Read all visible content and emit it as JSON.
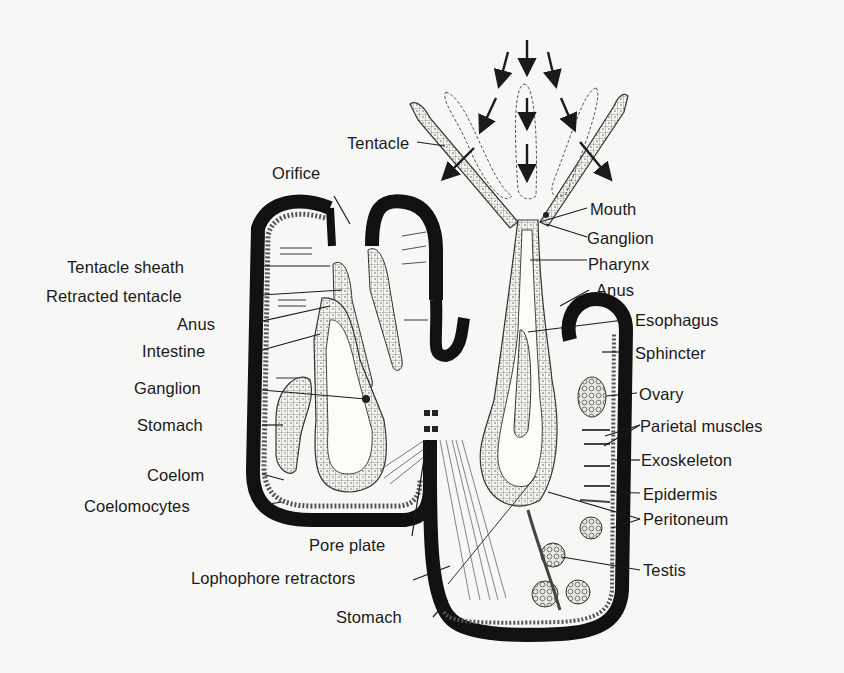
{
  "figure": {
    "colors": {
      "background": "#f7f7f5",
      "ink": "#1a1a1a",
      "exoskeleton": "#111111"
    }
  },
  "labels_left": [
    {
      "id": "orifice",
      "text": "Orifice"
    },
    {
      "id": "tentacle",
      "text": "Tentacle"
    },
    {
      "id": "tentacle-sheath",
      "text": "Tentacle sheath"
    },
    {
      "id": "retracted-tentacle",
      "text": "Retracted tentacle"
    },
    {
      "id": "anus-left",
      "text": "Anus"
    },
    {
      "id": "intestine",
      "text": "Intestine"
    },
    {
      "id": "ganglion-left",
      "text": "Ganglion"
    },
    {
      "id": "stomach-left",
      "text": "Stomach"
    },
    {
      "id": "coelom",
      "text": "Coelom"
    },
    {
      "id": "coelomocytes",
      "text": "Coelomocytes"
    },
    {
      "id": "pore-plate",
      "text": "Pore plate"
    },
    {
      "id": "lophophore-retractors",
      "text": "Lophophore retractors"
    },
    {
      "id": "stomach-bottom",
      "text": "Stomach"
    }
  ],
  "labels_right": [
    {
      "id": "mouth",
      "text": "Mouth"
    },
    {
      "id": "ganglion-right",
      "text": "Ganglion"
    },
    {
      "id": "pharynx",
      "text": "Pharynx"
    },
    {
      "id": "anus-right",
      "text": "Anus"
    },
    {
      "id": "esophagus",
      "text": "Esophagus"
    },
    {
      "id": "sphincter",
      "text": "Sphincter"
    },
    {
      "id": "ovary",
      "text": "Ovary"
    },
    {
      "id": "parietal-muscles",
      "text": "Parietal muscles"
    },
    {
      "id": "exoskeleton",
      "text": "Exoskeleton"
    },
    {
      "id": "epidermis",
      "text": "Epidermis"
    },
    {
      "id": "peritoneum",
      "text": "Peritoneum"
    },
    {
      "id": "testis",
      "text": "Testis"
    }
  ],
  "annotations": {
    "arrows": "Water current arrows converging into extended lophophore",
    "arrow_count": 9
  }
}
